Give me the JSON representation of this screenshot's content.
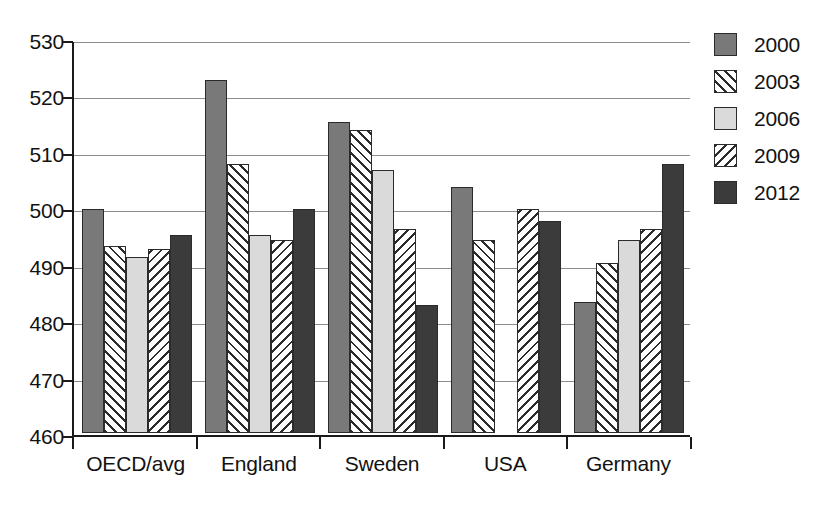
{
  "chart_data": {
    "type": "bar",
    "title": "",
    "xlabel": "",
    "ylabel": "",
    "ylim": [
      460,
      530
    ],
    "ytick_step": 10,
    "yticks": [
      460,
      470,
      480,
      490,
      500,
      510,
      520,
      530
    ],
    "grid": true,
    "legend_position": "right",
    "categories": [
      "OECD/avg",
      "England",
      "Sweden",
      "USA",
      "Germany"
    ],
    "series": [
      {
        "name": "2000",
        "values": [
          500,
          523,
          515.5,
          504,
          483.5
        ]
      },
      {
        "name": "2003",
        "values": [
          493.5,
          508,
          514,
          494.5,
          490.5
        ]
      },
      {
        "name": "2006",
        "values": [
          491.5,
          495.5,
          507,
          null,
          494.5
        ]
      },
      {
        "name": "2009",
        "values": [
          493,
          494.5,
          496.5,
          500,
          496.5
        ]
      },
      {
        "name": "2012",
        "values": [
          495.5,
          500,
          483,
          498,
          508
        ]
      }
    ],
    "series_styles": [
      {
        "name": "2000",
        "fill": "#797979",
        "pattern": "solid"
      },
      {
        "name": "2003",
        "fill": "#ffffff",
        "pattern": "forward-hatch"
      },
      {
        "name": "2006",
        "fill": "#dadada",
        "pattern": "solid"
      },
      {
        "name": "2009",
        "fill": "#ffffff",
        "pattern": "back-hatch"
      },
      {
        "name": "2012",
        "fill": "#3b3b3b",
        "pattern": "solid"
      }
    ]
  },
  "axis": {
    "tick_labels": [
      "530",
      "520",
      "510",
      "500",
      "490",
      "480",
      "470",
      "460"
    ]
  },
  "legend": {
    "items": [
      {
        "label": "2000"
      },
      {
        "label": "2003"
      },
      {
        "label": "2006"
      },
      {
        "label": "2009"
      },
      {
        "label": "2012"
      }
    ]
  },
  "colors": {
    "axis": "#1a1a1a",
    "grid": "#8d8d8d",
    "text": "#121212",
    "background": "#ffffff"
  }
}
